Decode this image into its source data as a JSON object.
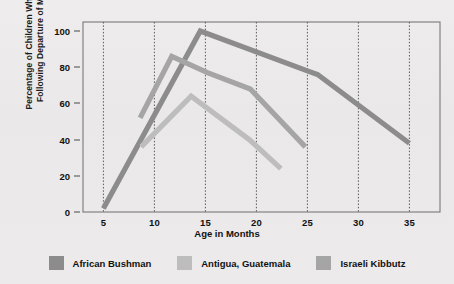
{
  "chart_data": {
    "type": "line",
    "title": "",
    "xlabel": "Age in Months",
    "ylabel": "Percentage of Children Who Cried Following Departure of Mother",
    "ylabel_line1": "Percentage of Children Who Cried",
    "ylabel_line2": "Following Departure of Mother",
    "xlim": [
      3,
      38
    ],
    "ylim": [
      0,
      105
    ],
    "xticks": [
      "5",
      "10",
      "15",
      "20",
      "25",
      "30",
      "35"
    ],
    "xtick_values": [
      5,
      10,
      15,
      20,
      25,
      30,
      35
    ],
    "yticks": [
      "0",
      "20",
      "40",
      "60",
      "80",
      "100"
    ],
    "ytick_values": [
      0,
      20,
      40,
      60,
      80,
      100
    ],
    "grid": "vertical-dotted",
    "legend_position": "bottom",
    "series": [
      {
        "name": "African Bushman",
        "color": "#8c8c8c",
        "points": [
          [
            5,
            2
          ],
          [
            14.5,
            100
          ],
          [
            25,
            78
          ],
          [
            26,
            76
          ],
          [
            35,
            38
          ]
        ]
      },
      {
        "name": "Antigua, Guatemala",
        "color": "#bdbdbd",
        "points": [
          [
            8.7,
            36
          ],
          [
            13.6,
            64
          ],
          [
            19.3,
            40
          ],
          [
            22.4,
            24
          ]
        ]
      },
      {
        "name": "Israeli Kibbutz",
        "color": "#a5a5a5",
        "points": [
          [
            8.6,
            52
          ],
          [
            11.7,
            86
          ],
          [
            15.2,
            77
          ],
          [
            19.4,
            68
          ],
          [
            24.8,
            36
          ]
        ]
      }
    ]
  },
  "legend": {
    "items": [
      {
        "label": "African Bushman",
        "swatch_name": "legend-swatch-african-bushman",
        "color": "#8c8c8c"
      },
      {
        "label": "Antigua, Guatemala",
        "swatch_name": "legend-swatch-antigua-guatemala",
        "color": "#bdbdbd"
      },
      {
        "label": "Israeli Kibbutz",
        "swatch_name": "legend-swatch-israeli-kibbutz",
        "color": "#a5a5a5"
      }
    ]
  },
  "axes": {
    "frame_color": "#6e6e6e",
    "grid_color": "#5a5a5a",
    "tick_color": "#4a4a4a"
  }
}
